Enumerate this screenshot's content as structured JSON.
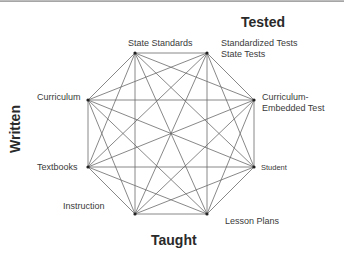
{
  "diagram": {
    "axis_labels": {
      "tested": "Tested",
      "written": "Written",
      "taught": "Taught"
    },
    "nodes": [
      {
        "id": "state-standards",
        "label": "State Standards",
        "x": 135,
        "y": 53
      },
      {
        "id": "standardized-tests",
        "label": "Standardized Tests",
        "label2": "State Tests",
        "x": 207,
        "y": 53
      },
      {
        "id": "curriculum-embedded-test",
        "label": "Curriculum-",
        "label2": "Embedded Test",
        "x": 254,
        "y": 100
      },
      {
        "id": "student",
        "label": "Student",
        "x": 254,
        "y": 167
      },
      {
        "id": "lesson-plans",
        "label": "Lesson Plans",
        "x": 207,
        "y": 214
      },
      {
        "id": "instruction",
        "label": "Instruction",
        "x": 135,
        "y": 214
      },
      {
        "id": "textbooks",
        "label": "Textbooks",
        "x": 88,
        "y": 167
      },
      {
        "id": "curriculum",
        "label": "Curriculum",
        "x": 88,
        "y": 100
      }
    ],
    "edges": "complete-graph",
    "line_color": "#6a6a6a",
    "node_color": "#222222"
  }
}
